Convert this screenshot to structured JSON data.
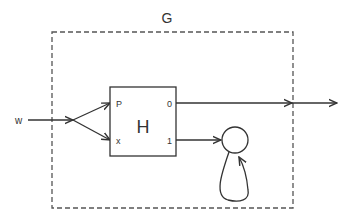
{
  "diagram": {
    "outer_box": {
      "label": "G"
    },
    "inner_box": {
      "label": "H",
      "input_ports": [
        "P",
        "x"
      ],
      "output_ports": [
        "0",
        "1"
      ]
    },
    "input_label": "w",
    "nodes": [
      {
        "id": "circle-state",
        "shape": "circle",
        "has_self_loop": true
      }
    ],
    "edges": [
      {
        "from": "w",
        "to": "split"
      },
      {
        "from": "split",
        "to": "H.P"
      },
      {
        "from": "split",
        "to": "H.x"
      },
      {
        "from": "H.0",
        "to": "output"
      },
      {
        "from": "H.1",
        "to": "circle-state"
      },
      {
        "from": "circle-state",
        "to": "circle-state"
      }
    ],
    "colors": {
      "stroke": "#333333",
      "dashed_border": "#555555",
      "background": "#ffffff"
    }
  }
}
